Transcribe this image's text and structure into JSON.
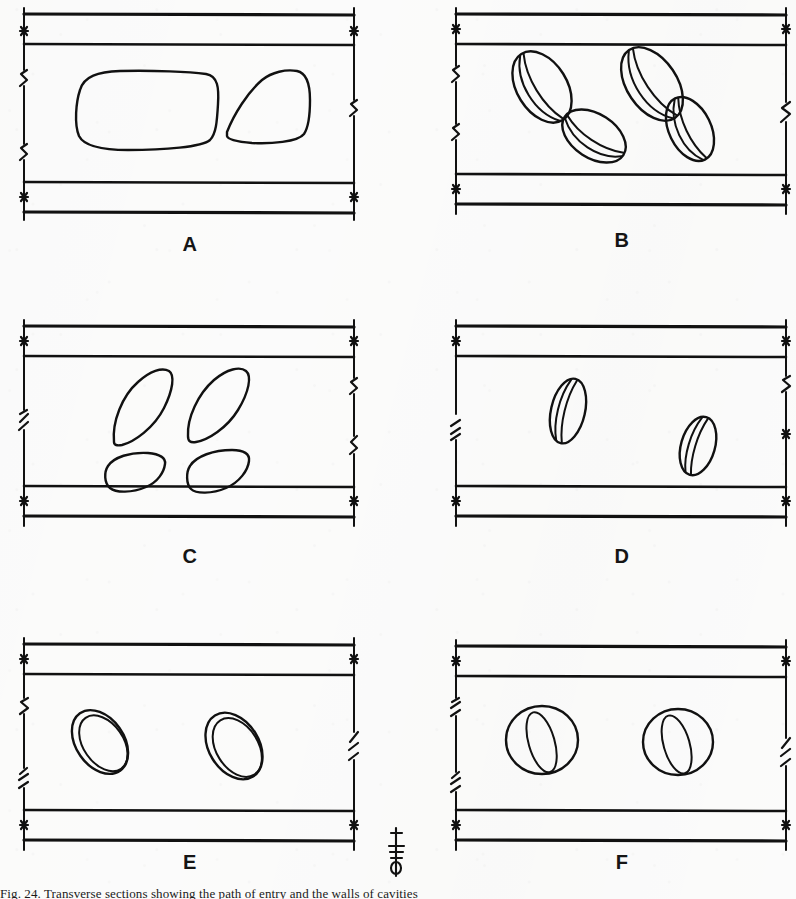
{
  "figure": {
    "panel_count": 6,
    "sheet_width": 796,
    "sheet_height": 899,
    "background_color": "#fdfdfd",
    "ink_color": "#111111",
    "caption_text": "Fig. 24.  Transverse sections showing the path of entry and the walls of cavities",
    "scale_marker": {
      "name": "vertical-dimension-marker",
      "label": ""
    }
  },
  "panels": [
    {
      "id": "A",
      "label": "A",
      "row": 1,
      "column": 1,
      "inclusion_count": 2,
      "inclusion_style": "large-smooth-rounded-blob",
      "has_internal_lines": false,
      "description": "Two large rounded quadrilateral voids occupying the channel"
    },
    {
      "id": "B",
      "label": "B",
      "row": 1,
      "column": 2,
      "inclusion_count": 4,
      "inclusion_style": "tilted-ellipse-with-two-internal-arcs",
      "has_internal_lines": true,
      "description": "Four tilted oval bodies each marked with two internal longitudinal arcs"
    },
    {
      "id": "C",
      "label": "C",
      "row": 2,
      "column": 1,
      "inclusion_count": 4,
      "inclusion_style": "pointed-lens-leaf-outline",
      "has_internal_lines": false,
      "description": "Four pointed lens- or leaf-shaped outlines, two upright and two low"
    },
    {
      "id": "D",
      "label": "D",
      "row": 2,
      "column": 2,
      "inclusion_count": 2,
      "inclusion_style": "narrow-ellipse-with-two-internal-lines",
      "has_internal_lines": true,
      "description": "Two small narrow tilted ovals with a pair of internal lines"
    },
    {
      "id": "E",
      "label": "E",
      "row": 3,
      "column": 1,
      "inclusion_count": 2,
      "inclusion_style": "double-concentric-tilted-ellipse",
      "has_internal_lines": true,
      "description": "Two tilted ring-like bodies drawn as concentric ellipse pairs"
    },
    {
      "id": "F",
      "label": "F",
      "row": 3,
      "column": 2,
      "inclusion_count": 2,
      "inclusion_style": "circle-with-inner-tilted-ellipse",
      "has_internal_lines": true,
      "description": "Two near-circular bodies each enclosing a narrow tilted inner ellipse"
    }
  ]
}
